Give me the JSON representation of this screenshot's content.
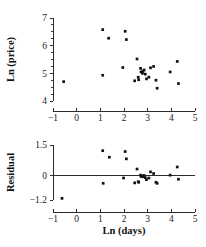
{
  "figure": {
    "background": "#ffffff",
    "marker_color": "#111111",
    "axis_color": "#2b2b2b"
  },
  "chart_data": [
    {
      "type": "scatter",
      "title": "",
      "xlabel": "",
      "ylabel": "Ln (price)",
      "xlim": [
        -1,
        5
      ],
      "ylim": [
        4,
        7
      ],
      "xticks": [
        -1,
        0,
        1,
        2,
        3,
        4,
        5
      ],
      "xticklabels": [
        "−1",
        "0",
        "1",
        "2",
        "3",
        "4",
        "5"
      ],
      "yticks": [
        4,
        5,
        6,
        7
      ],
      "yticklabels": [
        "4",
        "5",
        "6",
        "7"
      ],
      "yminorticks": [
        4.25,
        4.5,
        4.75,
        5.25,
        5.5,
        5.75,
        6.25,
        6.5,
        6.75
      ],
      "grid": false,
      "legend": null,
      "x": [
        -0.55,
        1.1,
        1.1,
        1.35,
        2.05,
        2.1,
        1.95,
        2.55,
        2.7,
        2.6,
        2.72,
        2.8,
        2.78,
        2.85,
        2.9,
        2.45,
        2.62,
        2.95,
        3.05,
        3.12,
        3.25,
        3.35,
        3.4,
        3.95,
        4.25,
        4.3
      ],
      "y": [
        4.7,
        6.58,
        4.93,
        6.27,
        6.52,
        6.22,
        5.21,
        5.52,
        5.18,
        4.86,
        5.05,
        5.08,
        5.0,
        5.12,
        4.97,
        4.73,
        4.77,
        4.8,
        4.86,
        5.2,
        5.25,
        4.75,
        4.46,
        5.05,
        5.43,
        4.63
      ]
    },
    {
      "type": "scatter",
      "title": "",
      "xlabel": "Ln (days)",
      "ylabel": "Residual",
      "xlim": [
        -1,
        5
      ],
      "ylim": [
        -1.2,
        1.5
      ],
      "xticks": [
        -1,
        0,
        1,
        2,
        3,
        4,
        5
      ],
      "xticklabels": [
        "−1",
        "0",
        "1",
        "2",
        "3",
        "4",
        "5"
      ],
      "yticks": [
        -1.2,
        0,
        1.5
      ],
      "yticklabels": [
        "−1.2",
        "0",
        "1.5"
      ],
      "grid": false,
      "reference_line": 0,
      "legend": null,
      "x": [
        -0.62,
        1.1,
        1.12,
        1.38,
        2.05,
        2.1,
        1.98,
        2.55,
        2.7,
        2.6,
        2.72,
        2.8,
        2.78,
        2.85,
        2.9,
        2.45,
        2.62,
        2.95,
        3.05,
        3.12,
        3.25,
        3.35,
        3.4,
        3.95,
        4.25,
        4.3
      ],
      "y": [
        -1.12,
        1.22,
        -0.38,
        0.9,
        1.18,
        0.82,
        -0.12,
        0.32,
        0.02,
        -0.3,
        -0.04,
        -0.02,
        -0.06,
        0.0,
        -0.1,
        -0.36,
        -0.33,
        -0.2,
        -0.12,
        0.18,
        0.1,
        -0.33,
        -0.38,
        0.02,
        0.42,
        -0.18
      ]
    }
  ]
}
